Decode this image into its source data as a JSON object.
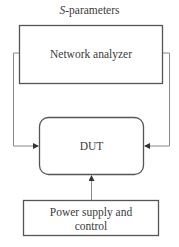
{
  "title": {
    "italic": "S",
    "rest": "-parameters"
  },
  "nodes": {
    "network_analyzer": {
      "label": "Network analyzer"
    },
    "dut": {
      "label": "DUT"
    },
    "power": {
      "label_line1": "Power supply and",
      "label_line2": "control"
    }
  },
  "edges": [
    {
      "from": "network_analyzer",
      "to": "dut",
      "side": "left"
    },
    {
      "from": "network_analyzer",
      "to": "dut",
      "side": "right"
    },
    {
      "from": "power",
      "to": "dut",
      "side": "bottom"
    }
  ],
  "colors": {
    "box_stroke": "#555555",
    "line_stroke": "#888888"
  }
}
